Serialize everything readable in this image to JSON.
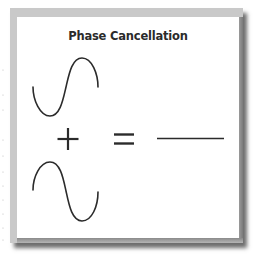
{
  "figure": {
    "title": "Phase Cancellation",
    "elements": [
      {
        "name": "sine-wave-top",
        "description": "sine wave, starts going down, trough then peak"
      },
      {
        "name": "plus-sign",
        "symbol": "+"
      },
      {
        "name": "sine-wave-bottom",
        "description": "inverted sine wave, peak then trough (180° out of phase)"
      },
      {
        "name": "equals-sign",
        "symbol": "="
      },
      {
        "name": "flat-line",
        "description": "flat line representing silence / cancellation result"
      }
    ],
    "colors": {
      "stroke": "#2b2b2b",
      "card_border": "#c9c9c9",
      "card_background": "#ffffff",
      "shadow": "#7a7a7a"
    }
  }
}
